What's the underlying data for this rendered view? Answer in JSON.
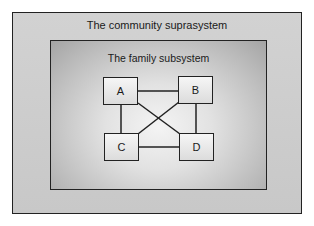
{
  "diagram": {
    "outer_label": "The community suprasystem",
    "inner_label": "The family subsystem",
    "nodes": [
      {
        "id": "A",
        "label": "A"
      },
      {
        "id": "B",
        "label": "B"
      },
      {
        "id": "C",
        "label": "C"
      },
      {
        "id": "D",
        "label": "D"
      }
    ],
    "edges": [
      [
        "A",
        "B"
      ],
      [
        "A",
        "C"
      ],
      [
        "B",
        "D"
      ],
      [
        "C",
        "D"
      ],
      [
        "A",
        "D"
      ],
      [
        "B",
        "C"
      ]
    ],
    "colors": {
      "border": "#222222",
      "outer_fill": "#cdcdcd",
      "inner_fill_center": "#f4f4f4",
      "inner_fill_edge": "#a4a4a4"
    }
  }
}
